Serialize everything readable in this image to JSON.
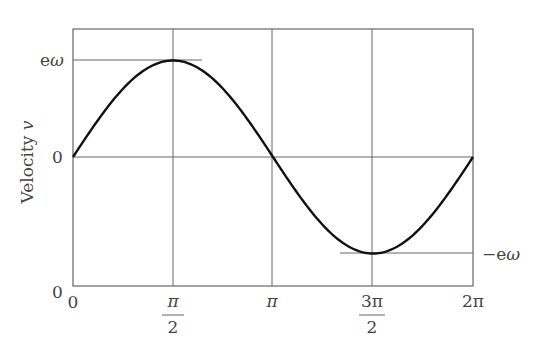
{
  "chart_data": {
    "type": "line",
    "title": "",
    "xlabel": "",
    "ylabel": "Velocity v",
    "ylabel_parts": {
      "text": "Velocity",
      "var": "v"
    },
    "x_ticks": [
      {
        "value": 0,
        "label": "0"
      },
      {
        "value": 1.5708,
        "label": "π/2",
        "num": "π",
        "den": "2"
      },
      {
        "value": 3.1416,
        "label": "π"
      },
      {
        "value": 4.7124,
        "label": "3π/2",
        "num": "3π",
        "den": "2"
      },
      {
        "value": 6.2832,
        "label": "2π"
      }
    ],
    "y_ticks": [
      {
        "value": 1,
        "label": "eω"
      },
      {
        "value": 0,
        "label": "0"
      },
      {
        "value": -1,
        "label": "0"
      }
    ],
    "annotations": [
      {
        "text": "−eω",
        "at_y": -1,
        "position": "right"
      }
    ],
    "series": [
      {
        "name": "v = eω sin θ",
        "x": [
          0,
          0.7854,
          1.5708,
          2.3562,
          3.1416,
          3.927,
          4.7124,
          5.4978,
          6.2832
        ],
        "y": [
          0,
          0.707,
          1,
          0.707,
          0,
          -0.707,
          -1,
          -0.707,
          0
        ]
      }
    ],
    "xlim": [
      0,
      6.2832
    ],
    "ylim": [
      -1.33,
      1.33
    ],
    "grid": true,
    "legend": "none"
  }
}
